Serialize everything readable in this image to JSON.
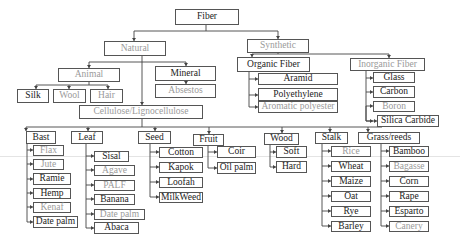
{
  "diagram": {
    "root": {
      "label": "Fiber"
    },
    "natural": {
      "label": "Natural"
    },
    "synthetic": {
      "label": "Synthetic"
    },
    "animal": {
      "label": "Animal",
      "children": [
        {
          "label": "Silk"
        },
        {
          "label": "Wool"
        },
        {
          "label": "Hair"
        }
      ]
    },
    "mineral": {
      "label": "Mineral",
      "children": [
        {
          "label": "Absestos"
        }
      ]
    },
    "cellulose": {
      "label": "Cellulose/Lignocellulose"
    },
    "organic": {
      "label": "Organic Fiber",
      "children": [
        {
          "label": "Aramid"
        },
        {
          "label": "Polyethylene"
        },
        {
          "label": "Aromatic polyester"
        }
      ]
    },
    "inorganic": {
      "label": "Inorganic Fiber",
      "children": [
        {
          "label": "Glass"
        },
        {
          "label": "Carbon"
        },
        {
          "label": "Boron"
        },
        {
          "label": "Silica Carbide"
        }
      ]
    },
    "bast": {
      "label": "Bast",
      "children": [
        {
          "label": "Flax"
        },
        {
          "label": "Jute"
        },
        {
          "label": "Ramie"
        },
        {
          "label": "Hemp"
        },
        {
          "label": "Kenaf"
        },
        {
          "label": "Date palm"
        }
      ]
    },
    "leaf": {
      "label": "Leaf",
      "children": [
        {
          "label": "Sisal"
        },
        {
          "label": "Agave"
        },
        {
          "label": "PALF"
        },
        {
          "label": "Banana"
        },
        {
          "label": "Date palm"
        },
        {
          "label": "Abaca"
        }
      ]
    },
    "seed": {
      "label": "Seed",
      "children": [
        {
          "label": "Cotton"
        },
        {
          "label": "Kapok"
        },
        {
          "label": "Loofah"
        },
        {
          "label": "MilkWeed"
        }
      ]
    },
    "fruit": {
      "label": "Fruit",
      "children": [
        {
          "label": "Coir"
        },
        {
          "label": "Oil palm"
        }
      ]
    },
    "wood": {
      "label": "Wood",
      "children": [
        {
          "label": "Soft"
        },
        {
          "label": "Hard"
        }
      ]
    },
    "stalk": {
      "label": "Stalk",
      "children": [
        {
          "label": "Rice"
        },
        {
          "label": "Wheat"
        },
        {
          "label": "Maize"
        },
        {
          "label": "Oat"
        },
        {
          "label": "Rye"
        },
        {
          "label": "Barley"
        }
      ]
    },
    "grass": {
      "label": "Grass/reeds",
      "children": [
        {
          "label": "Bamboo"
        },
        {
          "label": "Bagasse"
        },
        {
          "label": "Corn"
        },
        {
          "label": "Rape"
        },
        {
          "label": "Esparto"
        },
        {
          "label": "Canery"
        }
      ]
    }
  },
  "colors": {
    "line": "#444444",
    "text_dark": "#222222",
    "text_gray": "#9a9a9a"
  }
}
